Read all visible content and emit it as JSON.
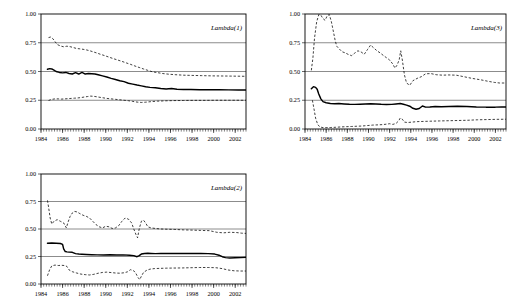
{
  "figure": {
    "panel_count": 3,
    "background_color": "#ffffff",
    "line_color": "#000000",
    "grid_color": "#8c8c8c"
  },
  "chart_data": [
    {
      "id": "lambda1",
      "type": "line",
      "title": "",
      "annotation": "Lambda(1)",
      "xlabel": "",
      "ylabel": "",
      "xlim": [
        1984.0,
        2003.0
      ],
      "ylim": [
        0.0,
        1.0
      ],
      "yticks": [
        0.0,
        0.25,
        0.5,
        0.75,
        1.0
      ],
      "ytick_labels": [
        "0.00",
        "0.25",
        "0.50",
        "0.75",
        "1.00"
      ],
      "xticks": [
        1984,
        1986,
        1988,
        1990,
        1992,
        1994,
        1996,
        1998,
        2000,
        2002
      ],
      "xtick_labels": [
        "1984",
        "1986",
        "1988",
        "1990",
        "1992",
        "1994",
        "1996",
        "1998",
        "2000",
        "2002"
      ],
      "grid": true,
      "legend": "none",
      "series": [
        {
          "name": "upper-band",
          "style": "dashed",
          "x": [
            1984.7,
            1984.9,
            1985.1,
            1985.3,
            1985.5,
            1985.8,
            1986.1,
            1986.4,
            1986.7,
            1987.0,
            1987.3,
            1987.6,
            1987.9,
            1988.2,
            1988.5,
            1988.8,
            1989.1,
            1989.5,
            1989.9,
            1990.3,
            1990.7,
            1991.1,
            1991.5,
            1991.9,
            1992.3,
            1992.7,
            1993.1,
            1993.5,
            1993.9,
            1994.3,
            1994.8,
            1995.3,
            1995.9,
            1996.5,
            1997.2,
            1998.0,
            1998.9,
            1999.8,
            2000.7,
            2001.6,
            2002.5,
            2003.0
          ],
          "y": [
            0.795,
            0.8,
            0.785,
            0.76,
            0.735,
            0.722,
            0.715,
            0.72,
            0.716,
            0.708,
            0.7,
            0.697,
            0.693,
            0.688,
            0.681,
            0.672,
            0.663,
            0.65,
            0.638,
            0.625,
            0.612,
            0.6,
            0.588,
            0.575,
            0.562,
            0.548,
            0.535,
            0.522,
            0.51,
            0.498,
            0.49,
            0.482,
            0.476,
            0.472,
            0.468,
            0.466,
            0.464,
            0.462,
            0.461,
            0.46,
            0.459,
            0.458
          ]
        },
        {
          "name": "point-estimate",
          "style": "solid",
          "x": [
            1984.6,
            1984.8,
            1985.0,
            1985.2,
            1985.4,
            1985.7,
            1986.0,
            1986.3,
            1986.6,
            1986.9,
            1987.2,
            1987.5,
            1987.8,
            1988.1,
            1988.4,
            1988.7,
            1989.0,
            1989.3,
            1989.7,
            1990.1,
            1990.5,
            1990.9,
            1991.3,
            1991.7,
            1992.1,
            1992.5,
            1992.9,
            1993.3,
            1993.7,
            1994.1,
            1994.6,
            1995.1,
            1995.6,
            1996.1,
            1996.6,
            1997.2,
            1997.9,
            1998.7,
            1999.6,
            2000.5,
            2001.4,
            2002.3,
            2003.0
          ],
          "y": [
            0.52,
            0.525,
            0.522,
            0.512,
            0.5,
            0.492,
            0.488,
            0.492,
            0.483,
            0.478,
            0.49,
            0.478,
            0.492,
            0.478,
            0.482,
            0.48,
            0.478,
            0.472,
            0.462,
            0.452,
            0.44,
            0.43,
            0.42,
            0.412,
            0.398,
            0.39,
            0.382,
            0.375,
            0.368,
            0.362,
            0.358,
            0.352,
            0.348,
            0.352,
            0.346,
            0.344,
            0.343,
            0.342,
            0.341,
            0.341,
            0.34,
            0.34,
            0.34
          ]
        },
        {
          "name": "lower-band",
          "style": "dashed",
          "x": [
            1984.7,
            1985.0,
            1985.3,
            1985.6,
            1985.9,
            1986.2,
            1986.5,
            1986.8,
            1987.1,
            1987.4,
            1987.7,
            1988.0,
            1988.3,
            1988.6,
            1988.9,
            1989.3,
            1989.7,
            1990.1,
            1990.5,
            1990.9,
            1991.3,
            1991.7,
            1992.1,
            1992.5,
            1992.9,
            1993.3,
            1993.7,
            1994.2,
            1994.8,
            1995.5,
            1996.3,
            1997.2,
            1998.2,
            1999.3,
            2000.4,
            2001.5,
            2002.5,
            2003.0
          ],
          "y": [
            0.248,
            0.258,
            0.262,
            0.262,
            0.26,
            0.262,
            0.264,
            0.266,
            0.268,
            0.27,
            0.273,
            0.278,
            0.282,
            0.286,
            0.284,
            0.278,
            0.272,
            0.266,
            0.262,
            0.258,
            0.254,
            0.25,
            0.246,
            0.24,
            0.234,
            0.231,
            0.233,
            0.238,
            0.242,
            0.245,
            0.247,
            0.248,
            0.249,
            0.249,
            0.25,
            0.25,
            0.25,
            0.25
          ]
        }
      ]
    },
    {
      "id": "lambda3",
      "type": "line",
      "title": "",
      "annotation": "Lambda(3)",
      "xlabel": "",
      "ylabel": "",
      "xlim": [
        1984.0,
        2003.0
      ],
      "ylim": [
        0.0,
        1.0
      ],
      "yticks": [
        0.0,
        0.25,
        0.5,
        0.75,
        1.0
      ],
      "ytick_labels": [
        "0.00",
        "0.25",
        "0.50",
        "0.75",
        "1.00"
      ],
      "xticks": [
        1984,
        1986,
        1988,
        1990,
        1992,
        1994,
        1996,
        1998,
        2000,
        2002
      ],
      "xtick_labels": [
        "1984",
        "1986",
        "1988",
        "1990",
        "1992",
        "1994",
        "1996",
        "1998",
        "2000",
        "2002"
      ],
      "grid": true,
      "legend": "none",
      "series": [
        {
          "name": "upper-band",
          "style": "dashed",
          "x": [
            1984.6,
            1984.75,
            1984.9,
            1985.1,
            1985.3,
            1985.5,
            1985.7,
            1985.9,
            1986.1,
            1986.3,
            1986.5,
            1986.7,
            1986.85,
            1987.0,
            1987.2,
            1987.5,
            1987.8,
            1988.1,
            1988.4,
            1988.7,
            1989.0,
            1989.3,
            1989.6,
            1989.9,
            1990.2,
            1990.5,
            1990.8,
            1991.1,
            1991.4,
            1991.7,
            1992.0,
            1992.3,
            1992.5,
            1992.7,
            1992.9,
            1993.05,
            1993.2,
            1993.4,
            1993.6,
            1993.9,
            1994.2,
            1994.6,
            1995.0,
            1995.4,
            1995.9,
            1996.4,
            1997.0,
            1997.6,
            1998.3,
            1999.0,
            1999.8,
            2000.6,
            2001.3,
            2001.9,
            2002.4,
            2003.0
          ],
          "y": [
            0.51,
            0.62,
            0.79,
            0.93,
            0.995,
            0.99,
            0.96,
            0.945,
            0.985,
            0.995,
            0.93,
            0.84,
            0.77,
            0.72,
            0.7,
            0.672,
            0.662,
            0.648,
            0.638,
            0.66,
            0.68,
            0.67,
            0.65,
            0.69,
            0.73,
            0.705,
            0.68,
            0.662,
            0.64,
            0.62,
            0.6,
            0.565,
            0.53,
            0.555,
            0.6,
            0.68,
            0.6,
            0.47,
            0.4,
            0.38,
            0.42,
            0.44,
            0.455,
            0.48,
            0.482,
            0.472,
            0.468,
            0.47,
            0.468,
            0.455,
            0.44,
            0.428,
            0.415,
            0.405,
            0.4,
            0.4
          ]
        },
        {
          "name": "point-estimate",
          "style": "solid",
          "x": [
            1984.6,
            1984.8,
            1985.0,
            1985.15,
            1985.3,
            1985.5,
            1985.7,
            1986.0,
            1986.4,
            1986.8,
            1987.2,
            1987.7,
            1988.2,
            1988.7,
            1989.2,
            1989.7,
            1990.2,
            1990.7,
            1991.2,
            1991.7,
            1992.2,
            1992.6,
            1993.0,
            1993.3,
            1993.6,
            1993.9,
            1994.2,
            1994.5,
            1994.8,
            1995.1,
            1995.4,
            1995.8,
            1996.3,
            1996.9,
            1997.6,
            1998.4,
            1999.3,
            2000.2,
            2001.1,
            2002.0,
            2002.6,
            2003.0
          ],
          "y": [
            0.35,
            0.368,
            0.362,
            0.345,
            0.305,
            0.262,
            0.238,
            0.228,
            0.222,
            0.22,
            0.221,
            0.218,
            0.215,
            0.214,
            0.216,
            0.218,
            0.219,
            0.218,
            0.215,
            0.213,
            0.214,
            0.218,
            0.222,
            0.215,
            0.208,
            0.198,
            0.18,
            0.172,
            0.178,
            0.2,
            0.19,
            0.192,
            0.196,
            0.194,
            0.196,
            0.198,
            0.196,
            0.192,
            0.19,
            0.19,
            0.192,
            0.192
          ]
        },
        {
          "name": "lower-band",
          "style": "dashed",
          "x": [
            1984.7,
            1984.85,
            1985.0,
            1985.2,
            1985.4,
            1985.7,
            1986.0,
            1986.4,
            1986.9,
            1987.4,
            1987.9,
            1988.4,
            1988.9,
            1989.4,
            1989.9,
            1990.4,
            1990.9,
            1991.3,
            1991.7,
            1992.0,
            1992.3,
            1992.6,
            1992.85,
            1993.0,
            1993.2,
            1993.4,
            1993.7,
            1994.1,
            1994.6,
            1995.2,
            1995.9,
            1996.7,
            1997.6,
            1998.5,
            1999.4,
            2000.3,
            2001.2,
            2002.1,
            2003.0
          ],
          "y": [
            0.25,
            0.175,
            0.095,
            0.04,
            0.018,
            0.012,
            0.012,
            0.013,
            0.015,
            0.018,
            0.02,
            0.022,
            0.024,
            0.026,
            0.03,
            0.034,
            0.036,
            0.038,
            0.042,
            0.046,
            0.04,
            0.048,
            0.07,
            0.095,
            0.085,
            0.06,
            0.056,
            0.06,
            0.064,
            0.066,
            0.068,
            0.07,
            0.072,
            0.074,
            0.076,
            0.08,
            0.082,
            0.084,
            0.085
          ]
        }
      ]
    },
    {
      "id": "lambda2",
      "type": "line",
      "title": "",
      "annotation": "Lambda(2)",
      "xlabel": "",
      "ylabel": "",
      "xlim": [
        1984.0,
        2003.0
      ],
      "ylim": [
        0.0,
        1.0
      ],
      "yticks": [
        0.0,
        0.25,
        0.5,
        0.75,
        1.0
      ],
      "ytick_labels": [
        "0.00",
        "0.25",
        "0.50",
        "0.75",
        "1.00"
      ],
      "xticks": [
        1984,
        1986,
        1988,
        1990,
        1992,
        1994,
        1996,
        1998,
        2000,
        2002
      ],
      "xtick_labels": [
        "1984",
        "1986",
        "1988",
        "1990",
        "1992",
        "1994",
        "1996",
        "1998",
        "2000",
        "2002"
      ],
      "grid": true,
      "legend": "none",
      "series": [
        {
          "name": "upper-band",
          "style": "dashed",
          "x": [
            1984.6,
            1984.7,
            1984.85,
            1985.0,
            1985.2,
            1985.5,
            1985.8,
            1986.1,
            1986.35,
            1986.5,
            1986.7,
            1986.9,
            1987.1,
            1987.35,
            1987.6,
            1987.9,
            1988.2,
            1988.5,
            1988.8,
            1989.1,
            1989.4,
            1989.7,
            1990.0,
            1990.3,
            1990.6,
            1990.9,
            1991.2,
            1991.5,
            1991.8,
            1992.1,
            1992.4,
            1992.6,
            1992.8,
            1992.95,
            1993.1,
            1993.3,
            1993.5,
            1993.7,
            1993.9,
            1994.2,
            1994.6,
            1995.1,
            1995.7,
            1996.4,
            1997.2,
            1998.0,
            1998.8,
            1999.6,
            2000.3,
            2000.9,
            2001.5,
            2002.1,
            2002.6,
            2003.0
          ],
          "y": [
            0.76,
            0.7,
            0.6,
            0.545,
            0.57,
            0.585,
            0.57,
            0.555,
            0.51,
            0.56,
            0.615,
            0.645,
            0.66,
            0.655,
            0.64,
            0.625,
            0.615,
            0.6,
            0.57,
            0.54,
            0.52,
            0.51,
            0.525,
            0.52,
            0.505,
            0.51,
            0.53,
            0.57,
            0.6,
            0.59,
            0.555,
            0.5,
            0.45,
            0.42,
            0.5,
            0.57,
            0.58,
            0.555,
            0.52,
            0.51,
            0.505,
            0.5,
            0.498,
            0.496,
            0.492,
            0.49,
            0.487,
            0.485,
            0.47,
            0.465,
            0.47,
            0.468,
            0.462,
            0.46
          ]
        },
        {
          "name": "point-estimate",
          "style": "solid",
          "x": [
            1984.6,
            1985.0,
            1985.4,
            1985.8,
            1986.0,
            1986.1,
            1986.25,
            1986.4,
            1986.6,
            1986.9,
            1987.2,
            1987.5,
            1987.8,
            1988.2,
            1988.7,
            1989.2,
            1989.8,
            1990.4,
            1991.0,
            1991.6,
            1992.2,
            1992.6,
            1992.9,
            1993.1,
            1993.3,
            1993.6,
            1993.9,
            1994.2,
            1994.6,
            1995.1,
            1995.7,
            1996.4,
            1997.2,
            1998.0,
            1998.8,
            1999.5,
            2000.1,
            2000.5,
            2000.8,
            2001.1,
            2001.5,
            2002.0,
            2002.5,
            2003.0
          ],
          "y": [
            0.37,
            0.372,
            0.37,
            0.368,
            0.36,
            0.32,
            0.295,
            0.292,
            0.29,
            0.288,
            0.276,
            0.272,
            0.27,
            0.268,
            0.266,
            0.265,
            0.264,
            0.266,
            0.264,
            0.265,
            0.262,
            0.258,
            0.248,
            0.258,
            0.272,
            0.278,
            0.28,
            0.278,
            0.276,
            0.278,
            0.278,
            0.277,
            0.277,
            0.278,
            0.278,
            0.276,
            0.272,
            0.262,
            0.248,
            0.24,
            0.236,
            0.238,
            0.24,
            0.242
          ]
        },
        {
          "name": "lower-band",
          "style": "dashed",
          "x": [
            1984.6,
            1984.8,
            1985.0,
            1985.3,
            1985.6,
            1985.9,
            1986.2,
            1986.4,
            1986.6,
            1986.9,
            1987.3,
            1987.7,
            1988.1,
            1988.5,
            1988.9,
            1989.3,
            1989.7,
            1990.1,
            1990.5,
            1990.9,
            1991.3,
            1991.7,
            1992.0,
            1992.3,
            1992.6,
            1992.8,
            1993.0,
            1993.15,
            1993.3,
            1993.5,
            1993.8,
            1994.1,
            1994.5,
            1995.0,
            1995.6,
            1996.3,
            1997.1,
            1997.9,
            1998.7,
            1999.5,
            2000.2,
            2000.8,
            2001.3,
            2001.9,
            2002.5,
            2003.0
          ],
          "y": [
            0.075,
            0.13,
            0.165,
            0.172,
            0.168,
            0.17,
            0.168,
            0.16,
            0.128,
            0.112,
            0.1,
            0.09,
            0.085,
            0.082,
            0.088,
            0.098,
            0.105,
            0.108,
            0.104,
            0.1,
            0.098,
            0.102,
            0.11,
            0.13,
            0.12,
            0.095,
            0.058,
            0.04,
            0.07,
            0.105,
            0.125,
            0.135,
            0.14,
            0.142,
            0.144,
            0.145,
            0.146,
            0.148,
            0.15,
            0.15,
            0.148,
            0.14,
            0.128,
            0.12,
            0.118,
            0.118
          ]
        }
      ]
    }
  ]
}
